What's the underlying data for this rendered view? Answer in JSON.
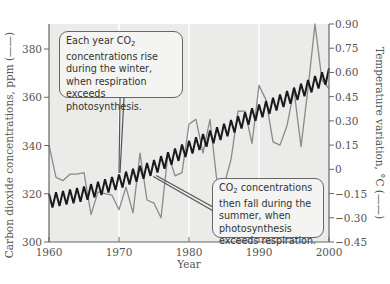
{
  "chart_data": {
    "type": "line",
    "title": "",
    "xlabel": "Year",
    "ylabel_left": "Carbon dioxide concentrations, ppm",
    "ylabel_right": "Temperature variation, °C",
    "xlim": [
      1960,
      2000
    ],
    "ylim_left": [
      300,
      390
    ],
    "ylim_right": [
      -0.45,
      0.9
    ],
    "x_ticks": [
      "1960",
      "1970",
      "1980",
      "1990",
      "2000"
    ],
    "y_left_ticks": [
      "300",
      "320",
      "340",
      "360",
      "380"
    ],
    "y_right_ticks": [
      "0.90",
      "0.75",
      "0.60",
      "0.45",
      "0.30",
      "0.15",
      "0",
      "−0.15",
      "−0.30",
      "−0.45"
    ],
    "grid": "vertical lines at decades (white)",
    "series": [
      {
        "name": "Carbon dioxide concentration (ppm)",
        "axis": "left",
        "color": "#1a1a1a",
        "style": "seasonal zigzag",
        "annual_mean": {
          "x": [
            1960,
            1965,
            1970,
            1975,
            1980,
            1985,
            1990,
            1995,
            2000
          ],
          "y": [
            317,
            320,
            325,
            331,
            339,
            346,
            354,
            361,
            369
          ]
        },
        "seasonal_amplitude_ppm": 6
      },
      {
        "name": "Temperature variation (°C)",
        "axis": "right",
        "color": "#8a8a8a",
        "x": [
          1960,
          1961,
          1962,
          1963,
          1964,
          1965,
          1966,
          1967,
          1968,
          1969,
          1970,
          1971,
          1972,
          1973,
          1974,
          1975,
          1976,
          1977,
          1978,
          1979,
          1980,
          1981,
          1982,
          1983,
          1984,
          1985,
          1986,
          1987,
          1988,
          1989,
          1990,
          1991,
          1992,
          1993,
          1994,
          1995,
          1996,
          1997,
          1998,
          1999,
          2000
        ],
        "y": [
          0.15,
          -0.05,
          -0.07,
          -0.03,
          -0.03,
          -0.02,
          -0.28,
          -0.14,
          -0.15,
          -0.16,
          -0.25,
          -0.11,
          -0.27,
          0.1,
          -0.19,
          -0.21,
          -0.3,
          0.1,
          -0.04,
          -0.02,
          0.28,
          0.31,
          0.1,
          0.31,
          -0.08,
          -0.1,
          0.06,
          0.36,
          0.36,
          0.16,
          0.52,
          0.43,
          0.17,
          0.15,
          0.27,
          0.49,
          0.14,
          0.5,
          0.9,
          0.55,
          0.5
        ]
      }
    ],
    "annotations": [
      "Each year CO2 concentrations rise during the winter, when respiration exceeds photosynthesis.",
      "CO2 concentrations then fall during the summer, when photosynthesis exceeds respiration."
    ]
  },
  "labels": {
    "xlabel": "Year",
    "ylabel_left": "Carbon dioxide concentrations, ppm (——)",
    "ylabel_right": "Temperature variation, °C (——)"
  },
  "callouts": {
    "top": {
      "pre": "Each year CO",
      "sub": "2",
      "post": " concentrations rise during the winter, when respiration exceeds photosynthesis."
    },
    "bottom": {
      "pre": "CO",
      "sub": "2",
      "post": " concentrations then fall during the summer, when photosynthesis exceeds respiration."
    }
  }
}
